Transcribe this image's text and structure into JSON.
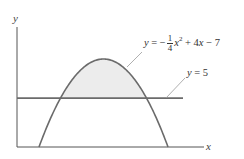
{
  "chart_data": {
    "type": "line",
    "title": "",
    "xlabel": "x",
    "ylabel": "y",
    "grid": false,
    "xlim": [
      0.5,
      16.9
    ],
    "ylim": [
      0,
      12
    ],
    "series": [
      {
        "name": "parabola",
        "label": "y = -1/4 x^2 + 4x - 7",
        "equation": {
          "a": -0.25,
          "b": 4,
          "c": -7
        },
        "roots": [
          2,
          14
        ],
        "vertex": [
          8,
          9
        ]
      },
      {
        "name": "horizontal line",
        "label": "y = 5",
        "value": 5
      }
    ],
    "shaded_region": {
      "between": [
        "y = -1/4 x^2 + 4x - 7",
        "y = 5"
      ],
      "x_range": [
        4,
        12
      ],
      "color": "#ececec"
    },
    "intersections": [
      [
        4,
        5
      ],
      [
        12,
        5
      ]
    ]
  },
  "labels": {
    "y_axis": "y",
    "x_axis": "x",
    "parabola_eq": {
      "lhs": "y",
      "eq": "=",
      "minus": "−",
      "frac_num": "1",
      "frac_den": "4",
      "var": "x",
      "exp": "2",
      "rest_plus": "+ 4",
      "rest_var": "x",
      "rest_minus": "− 7"
    },
    "line_eq": {
      "lhs": "y",
      "rhs": "= 5"
    }
  },
  "colors": {
    "axes": "#555555",
    "curve": "#6b6b6b",
    "shade": "#ececec",
    "leader": "#9a9a9a"
  }
}
